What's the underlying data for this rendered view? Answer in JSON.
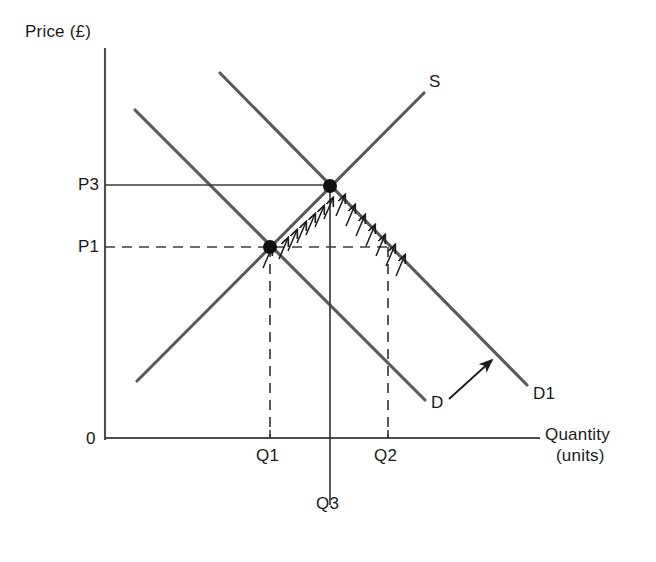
{
  "title_labels": {
    "y_axis": "Price (£)",
    "x_axis_line1": "Quantity",
    "x_axis_line2": "(units)",
    "origin": "0"
  },
  "price_ticks": [
    {
      "label": "P3",
      "x": 78,
      "y": 177,
      "value_y": 185
    },
    {
      "label": "P1",
      "x": 78,
      "y": 239,
      "value_y": 247
    }
  ],
  "quantity_ticks": [
    {
      "label": "Q1",
      "x": 256,
      "y": 446,
      "value_x": 270
    },
    {
      "label": "Q2",
      "x": 374,
      "y": 446,
      "value_x": 388
    },
    {
      "label": "Q3",
      "x": 316,
      "y": 494,
      "value_x": 330
    }
  ],
  "curve_labels": [
    {
      "label": "S",
      "x": 429,
      "y": 74
    },
    {
      "label": "D",
      "x": 431,
      "y": 395
    },
    {
      "label": "D1",
      "x": 533,
      "y": 386
    }
  ],
  "colors": {
    "axis": "#4d4d4d",
    "curve": "#5a5a5a",
    "guide": "#3c3c3c",
    "dot": "#111111",
    "hatch": "#1a1a1a",
    "background": "#ffffff",
    "text": "#1a1a1a"
  },
  "chart_data": {
    "type": "line",
    "title": "",
    "xlabel": "Quantity (units)",
    "ylabel": "Price (£)",
    "grid": false,
    "legend": "inline curve labels",
    "axes": {
      "origin_px": {
        "x": 105,
        "y": 438
      },
      "y_axis_top_px": 48,
      "x_axis_right_px": 540
    },
    "series": [
      {
        "name": "S",
        "type": "supply",
        "label": "S",
        "slope": "upward",
        "points_px": [
          {
            "x": 137,
            "y": 381
          },
          {
            "x": 424,
            "y": 93
          }
        ]
      },
      {
        "name": "D",
        "type": "demand-original",
        "label": "D",
        "slope": "downward",
        "points_px": [
          {
            "x": 135,
            "y": 110
          },
          {
            "x": 425,
            "y": 400
          }
        ]
      },
      {
        "name": "D1",
        "type": "demand-shifted",
        "label": "D1",
        "slope": "downward",
        "points_px": [
          {
            "x": 220,
            "y": 73
          },
          {
            "x": 527,
            "y": 385
          }
        ]
      }
    ],
    "equilibria": [
      {
        "name": "initial",
        "price": "P1",
        "quantity": "Q1",
        "px": {
          "x": 270,
          "y": 247
        }
      },
      {
        "name": "new",
        "price": "P3",
        "quantity": "Q3",
        "px": {
          "x": 330,
          "y": 186
        }
      }
    ],
    "reference_lines": [
      {
        "name": "P3-horizontal",
        "style": "solid",
        "from_px": {
          "x": 105,
          "y": 185
        },
        "to_px": {
          "x": 330,
          "y": 185
        }
      },
      {
        "name": "P1-horizontal",
        "style": "dashed",
        "from_px": {
          "x": 105,
          "y": 247
        },
        "to_px": {
          "x": 388,
          "y": 247
        }
      },
      {
        "name": "Q1-vertical",
        "style": "dashed",
        "from_px": {
          "x": 270,
          "y": 247
        },
        "to_px": {
          "x": 270,
          "y": 438
        }
      },
      {
        "name": "Q2-vertical",
        "style": "dashed",
        "from_px": {
          "x": 388,
          "y": 247
        },
        "to_px": {
          "x": 388,
          "y": 438
        }
      },
      {
        "name": "Q3-vertical",
        "style": "solid",
        "from_px": {
          "x": 330,
          "y": 186
        },
        "to_px": {
          "x": 330,
          "y": 505
        }
      }
    ],
    "shift_arrow": {
      "name": "demand-shift-arrow",
      "from_px": {
        "x": 449,
        "y": 399
      },
      "to_px": {
        "x": 492,
        "y": 360
      },
      "meaning": "demand shifts right from D to D1"
    },
    "hatching": {
      "meaning": "excess demand / movement along curves marked with tick arrows",
      "segments": [
        {
          "along": "D",
          "from_px": {
            "x": 270,
            "y": 247
          },
          "to_px": {
            "x": 330,
            "y": 186
          },
          "ticks": 7
        },
        {
          "along": "D1",
          "from_px": {
            "x": 330,
            "y": 186
          },
          "to_px": {
            "x": 400,
            "y": 256
          },
          "ticks": 7
        }
      ]
    }
  }
}
